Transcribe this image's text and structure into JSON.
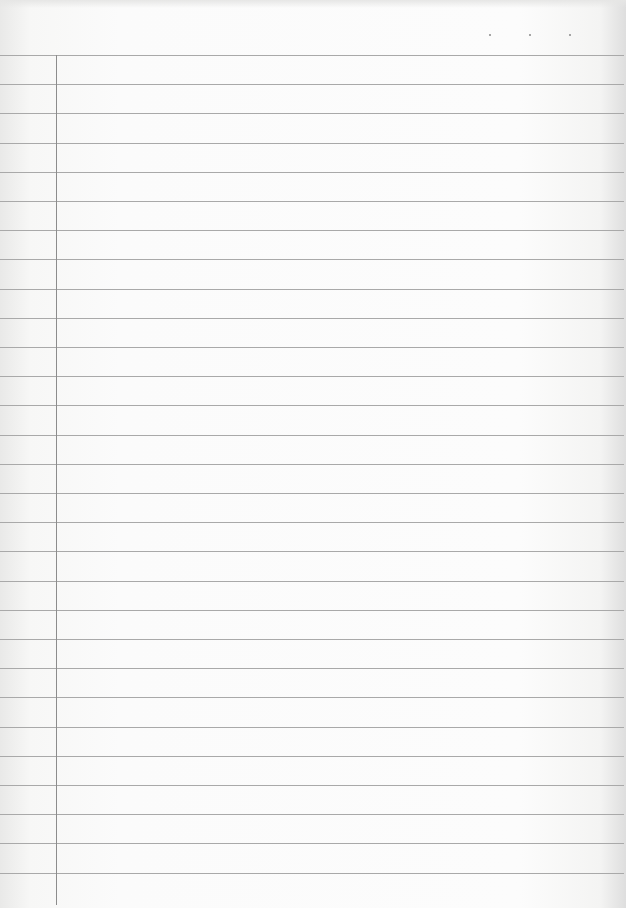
{
  "page": {
    "type": "lined-notebook-paper",
    "background": "#fbfbfb",
    "rule_color": "#a9a9a9",
    "margin_color": "#8c8c8c",
    "line_count": 29,
    "first_line_y": 55,
    "line_spacing": 29.2,
    "margin_x": 56,
    "header_dots": [
      {
        "x": 489
      },
      {
        "x": 529
      },
      {
        "x": 569
      }
    ]
  }
}
